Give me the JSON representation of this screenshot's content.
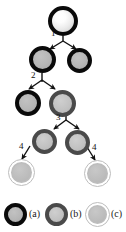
{
  "figure": {
    "background": "#ffffff",
    "width": 126,
    "height": 232
  },
  "colors": {
    "rim_black": "#0a0a0a",
    "rim_dark_grey": "#4a4a4a",
    "rim_pale_grey": "#bdbdbd",
    "fill_white": "#ffffff",
    "fill_mid_grey": "#b6b6b6",
    "fill_light_grey": "#c2c2c2",
    "arrow": "#111111",
    "label_text": "#111111"
  },
  "nodes": [
    {
      "id": "n0",
      "type": "w",
      "level": 1,
      "cx": 63,
      "cy": 21,
      "d": 29,
      "label": "initiator-cell"
    },
    {
      "id": "n1",
      "type": "a",
      "level": 2,
      "cx": 42,
      "cy": 59,
      "d": 26,
      "label": "type-a-cell"
    },
    {
      "id": "n2",
      "type": "a",
      "level": 2,
      "cx": 79,
      "cy": 60,
      "d": 24,
      "label": "type-a-cell"
    },
    {
      "id": "n3",
      "type": "a",
      "level": 3,
      "cx": 27,
      "cy": 102,
      "d": 25,
      "label": "type-a-cell"
    },
    {
      "id": "n4",
      "type": "b",
      "level": 3,
      "cx": 62,
      "cy": 103,
      "d": 26,
      "label": "type-b-cell"
    },
    {
      "id": "n5",
      "type": "b",
      "level": 4,
      "cx": 44,
      "cy": 141,
      "d": 25,
      "label": "type-b-cell"
    },
    {
      "id": "n6",
      "type": "b",
      "level": 4,
      "cx": 77,
      "cy": 142,
      "d": 25,
      "label": "type-b-cell"
    },
    {
      "id": "n7",
      "type": "c",
      "level": 5,
      "cx": 21,
      "cy": 172,
      "d": 25,
      "label": "type-c-cell"
    },
    {
      "id": "n8",
      "type": "c",
      "level": 5,
      "cx": 97,
      "cy": 173,
      "d": 25,
      "label": "type-c-cell"
    }
  ],
  "edges": [
    {
      "id": "e1",
      "label": "1",
      "from": "n0",
      "to": [
        "n1",
        "n2"
      ],
      "kind": "fork",
      "label_x": 51,
      "label_y": 31
    },
    {
      "id": "e2",
      "label": "2",
      "from": "n1",
      "to": [
        "n3",
        "n4"
      ],
      "kind": "fork",
      "label_x": 30,
      "label_y": 73
    },
    {
      "id": "e3",
      "label": "3",
      "from": "n4",
      "to": [
        "n5",
        "n6"
      ],
      "kind": "fork",
      "label_x": 55,
      "label_y": 115
    },
    {
      "id": "e4a",
      "label": "4",
      "from": "n5",
      "to": [
        "n7"
      ],
      "kind": "single",
      "label_x": 19,
      "label_y": 148
    },
    {
      "id": "e4b",
      "label": "4",
      "from": "n6",
      "to": [
        "n8"
      ],
      "kind": "single",
      "label_x": 91,
      "label_y": 149
    }
  ],
  "edge_labels": {
    "one": "1",
    "two": "2",
    "three": "3",
    "four_left": "4",
    "four_right": "4"
  },
  "legend": {
    "items": [
      {
        "key": "a",
        "type": "a",
        "label": "(a)",
        "x": 4,
        "label_x": 28,
        "d": 23
      },
      {
        "key": "b",
        "type": "b",
        "label": "(b)",
        "x": 45,
        "label_x": 69,
        "d": 23
      },
      {
        "key": "c",
        "type": "c",
        "label": "(c)",
        "x": 86,
        "label_x": 110,
        "d": 23
      }
    ]
  }
}
